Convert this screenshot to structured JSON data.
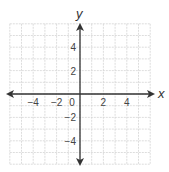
{
  "graph": {
    "type": "coordinate-plane",
    "x_axis_label": "x",
    "y_axis_label": "y",
    "x_range": [
      -6,
      6
    ],
    "y_range": [
      -6,
      6
    ],
    "grid_step": 1,
    "x_tick_labels": [
      {
        "value": -4,
        "text": "−4"
      },
      {
        "value": -2,
        "text": "−2"
      },
      {
        "value": 2,
        "text": "2"
      },
      {
        "value": 4,
        "text": "4"
      }
    ],
    "y_tick_labels": [
      {
        "value": 4,
        "text": "4"
      },
      {
        "value": 2,
        "text": "2"
      },
      {
        "value": -2,
        "text": "−2"
      },
      {
        "value": -4,
        "text": "−4"
      }
    ],
    "origin_label": "0",
    "colors": {
      "grid": "#d4d4d4",
      "axis": "#333333",
      "text": "#444444"
    }
  }
}
